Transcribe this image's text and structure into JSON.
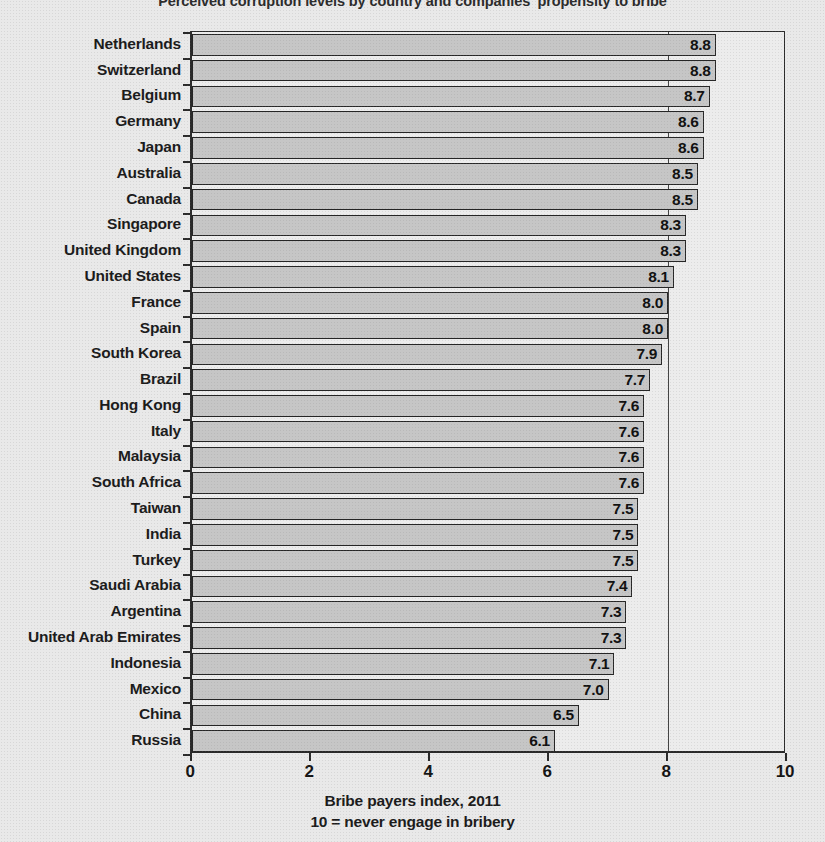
{
  "chart_data": {
    "type": "bar",
    "orientation": "horizontal",
    "title": "Perceived corruption levels by country and companies' propensity to bribe",
    "xlabel": "Bribe payers index, 2011",
    "xlabel_sub": "10 = never engage in bribery",
    "ylabel": "",
    "xlim": [
      0,
      10
    ],
    "xticks": [
      0,
      2,
      4,
      6,
      8,
      10
    ],
    "xtick_labels": [
      "0",
      "2",
      "4",
      "6",
      "8",
      "10"
    ],
    "gridlines": [
      8
    ],
    "grid": false,
    "legend": null,
    "bar_color": "#c6c6c6",
    "bar_edge_color": "#262626",
    "background_color": "#e9e9e9",
    "plot_background_color": "#ececec",
    "axis_color": "#2a2a2a",
    "value_label_position": "inside-end",
    "categories": [
      "Netherlands",
      "Switzerland",
      "Belgium",
      "Germany",
      "Japan",
      "Australia",
      "Canada",
      "Singapore",
      "United Kingdom",
      "United States",
      "France",
      "Spain",
      "South Korea",
      "Brazil",
      "Hong Kong",
      "Italy",
      "Malaysia",
      "South Africa",
      "Taiwan",
      "India",
      "Turkey",
      "Saudi Arabia",
      "Argentina",
      "United Arab Emirates",
      "Indonesia",
      "Mexico",
      "China",
      "Russia"
    ],
    "values": [
      8.8,
      8.8,
      8.7,
      8.6,
      8.6,
      8.5,
      8.5,
      8.3,
      8.3,
      8.1,
      8.0,
      8.0,
      7.9,
      7.7,
      7.6,
      7.6,
      7.6,
      7.6,
      7.5,
      7.5,
      7.5,
      7.4,
      7.3,
      7.3,
      7.1,
      7.0,
      6.5,
      6.1
    ],
    "value_labels": [
      "8.8",
      "8.8",
      "8.7",
      "8.6",
      "8.6",
      "8.5",
      "8.5",
      "8.3",
      "8.3",
      "8.1",
      "8.0",
      "8.0",
      "7.9",
      "7.7",
      "7.6",
      "7.6",
      "7.6",
      "7.6",
      "7.5",
      "7.5",
      "7.5",
      "7.4",
      "7.3",
      "7.3",
      "7.1",
      "7.0",
      "6.5",
      "6.1"
    ]
  }
}
